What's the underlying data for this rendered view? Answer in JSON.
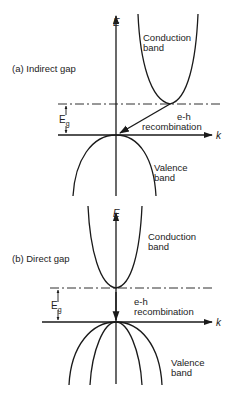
{
  "panels": [
    {
      "id": "a",
      "title": "(a)  Indirect gap",
      "axis_e": "E",
      "axis_k": "k",
      "gap_label": "E",
      "gap_sub": "g",
      "conduction_label": [
        "Conduction",
        "band"
      ],
      "valence_label": [
        "Valence",
        "band"
      ],
      "recombination_label": [
        "e-h",
        "recombination"
      ]
    },
    {
      "id": "b",
      "title": "(b) Direct  gap",
      "axis_e": "E",
      "axis_k": "k",
      "gap_label": "E",
      "gap_sub": "g",
      "conduction_label": [
        "Conduction",
        "band"
      ],
      "valence_label": [
        "Valence",
        "band"
      ],
      "recombination_label": [
        "e-h",
        "recombination"
      ]
    }
  ],
  "colors": {
    "line": "#1a1a1a",
    "background": "#ffffff"
  }
}
